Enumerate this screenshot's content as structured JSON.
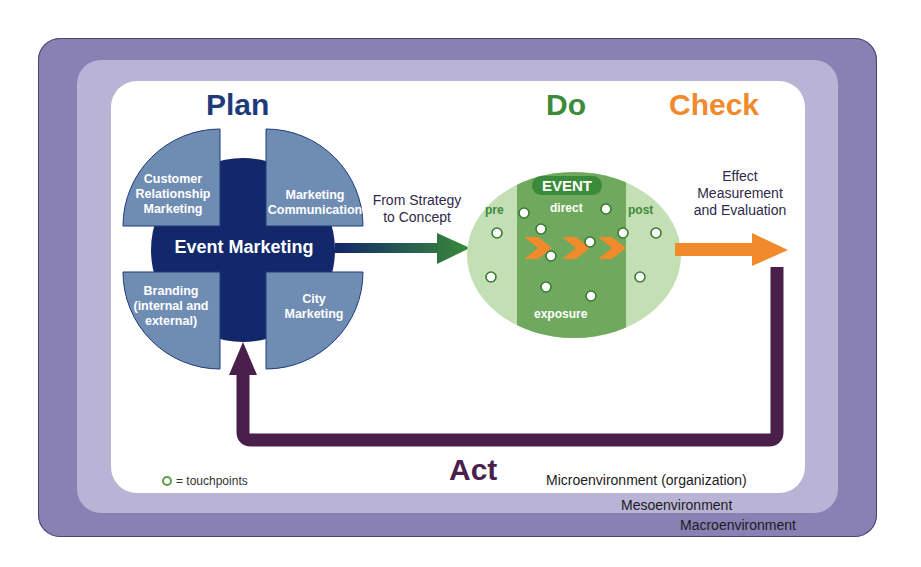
{
  "environments": {
    "macro": "Macroenvironment",
    "meso": "Mesoenvironment",
    "micro": "Microenvironment (organization)"
  },
  "phases": {
    "plan": "Plan",
    "do": "Do",
    "check": "Check",
    "act": "Act"
  },
  "plan": {
    "center": "Event Marketing",
    "quadrants": [
      {
        "position": "top-left",
        "label": "Customer\nRelationship\nMarketing"
      },
      {
        "position": "top-right",
        "label": "Marketing\nCommunication"
      },
      {
        "position": "bottom-left",
        "label": "Branding\n(internal and\nexternal)"
      },
      {
        "position": "bottom-right",
        "label": "City\nMarketing"
      }
    ]
  },
  "transitions": {
    "plan_to_do": "From Strategy\nto Concept",
    "do_to_check": "Effect\nMeasurement\nand Evaluation"
  },
  "event": {
    "badge": "EVENT",
    "pre": "pre",
    "direct": "direct",
    "post": "post",
    "exposure": "exposure",
    "touchpoint_count": 14
  },
  "legend": {
    "symbol": "circle-outline",
    "text": "= touchpoints"
  },
  "colors": {
    "macro": "#8980b4",
    "meso": "#b9b3d6",
    "plan_navy": "#12286a",
    "plan_quadrant": "#6f8db3",
    "do_green": "#3c8a3a",
    "check_orange": "#f08a2a",
    "act_purple": "#4a1f4c"
  }
}
